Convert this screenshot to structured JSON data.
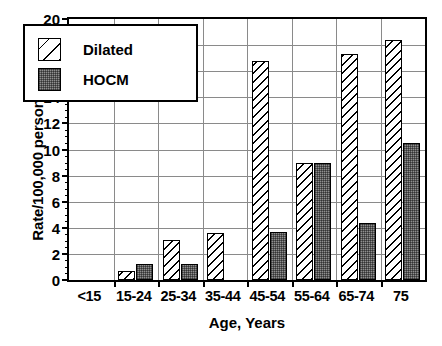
{
  "chart_data": {
    "type": "bar",
    "title": "",
    "xlabel": "Age, Years",
    "ylabel": "Rate/100,000 person-years",
    "categories": [
      "<15",
      "15-24",
      "25-34",
      "35-44",
      "45-54",
      "55-64",
      "65-74",
      "75"
    ],
    "series": [
      {
        "name": "Dilated",
        "values": [
          0,
          0.7,
          3.1,
          3.6,
          16.8,
          9.0,
          17.3,
          18.4
        ],
        "fill": "diagonal-hatch",
        "color": "#ffffff"
      },
      {
        "name": "HOCM",
        "values": [
          0,
          1.2,
          1.2,
          0,
          3.7,
          9.0,
          4.4,
          10.5
        ],
        "fill": "stipple-gray",
        "color": "#8f8f8f"
      }
    ],
    "ylim": [
      0,
      20
    ],
    "y_ticks": [
      0,
      2,
      4,
      6,
      8,
      10,
      12,
      14,
      16,
      18,
      20
    ],
    "y_tick_labels": [
      "0",
      "2",
      "4",
      "6",
      "8",
      "10",
      "12",
      "14",
      "16",
      "18",
      "20"
    ],
    "y_minor_tick_step": 0.5,
    "grid": "both",
    "legend_position": "upper-left-inside",
    "legend_entries": [
      "Dilated",
      "HOCM"
    ]
  }
}
